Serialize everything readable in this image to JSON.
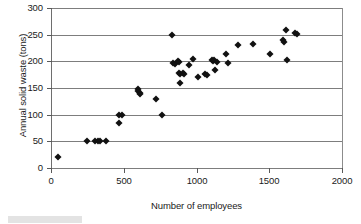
{
  "chart_data": {
    "type": "scatter",
    "title": "",
    "xlabel": "Number of employees",
    "ylabel": "Annual solid waste (tons)",
    "xlim": [
      0,
      2000
    ],
    "ylim": [
      0,
      300
    ],
    "xticks": [
      0,
      500,
      1000,
      1500,
      2000
    ],
    "yticks": [
      0,
      50,
      100,
      150,
      200,
      250,
      300
    ],
    "xtick_labels": [
      "0",
      "500",
      "1000",
      "1500",
      "2000"
    ],
    "ytick_labels": [
      "0",
      "50",
      "100",
      "150",
      "200",
      "250",
      "300"
    ],
    "grid": "horizontal",
    "legend": "none",
    "marker": "filled-diamond",
    "marker_color": "#111111",
    "series": [
      {
        "name": "Plants",
        "points": [
          [
            50,
            21
          ],
          [
            245,
            50
          ],
          [
            300,
            50
          ],
          [
            320,
            50
          ],
          [
            340,
            50
          ],
          [
            380,
            50
          ],
          [
            465,
            100
          ],
          [
            470,
            85
          ],
          [
            490,
            100
          ],
          [
            595,
            148
          ],
          [
            600,
            145
          ],
          [
            610,
            140
          ],
          [
            610,
            138
          ],
          [
            725,
            130
          ],
          [
            760,
            100
          ],
          [
            835,
            249
          ],
          [
            840,
            197
          ],
          [
            850,
            195
          ],
          [
            875,
            201
          ],
          [
            878,
            198
          ],
          [
            880,
            178
          ],
          [
            885,
            176
          ],
          [
            890,
            160
          ],
          [
            905,
            179
          ],
          [
            912,
            177
          ],
          [
            950,
            193
          ],
          [
            975,
            205
          ],
          [
            1010,
            171
          ],
          [
            1060,
            176
          ],
          [
            1070,
            174
          ],
          [
            1105,
            203
          ],
          [
            1112,
            200
          ],
          [
            1118,
            202
          ],
          [
            1130,
            184
          ],
          [
            1140,
            198
          ],
          [
            1200,
            213
          ],
          [
            1215,
            196
          ],
          [
            1285,
            230
          ],
          [
            1390,
            232
          ],
          [
            1505,
            213
          ],
          [
            1595,
            240
          ],
          [
            1600,
            236
          ],
          [
            1615,
            258
          ],
          [
            1625,
            202
          ],
          [
            1680,
            253
          ],
          [
            1690,
            251
          ]
        ]
      }
    ]
  },
  "axis": {
    "y_title": "Annual solid waste (tons)",
    "x_title": "Number of employees"
  }
}
